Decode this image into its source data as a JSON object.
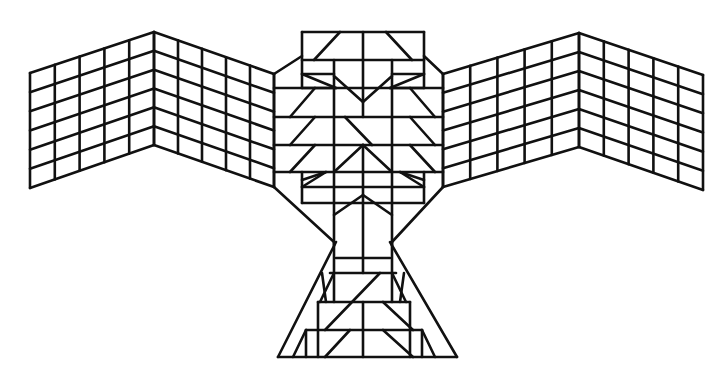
{
  "figure": {
    "title": "Geometric bird (thunderbird) line drawing",
    "stroke_color": "#111111",
    "background": "#ffffff"
  },
  "wings": {
    "left": {
      "outer": {
        "x": 30,
        "top": 73,
        "bottom": 188
      },
      "fold": {
        "x": 154,
        "top": 32,
        "bottom": 145
      },
      "inner": {
        "x": 274,
        "top": 74,
        "bottom": 187
      },
      "columns_per_panel": 5,
      "rows": 6
    },
    "right": {
      "inner": {
        "x": 443,
        "top": 74,
        "bottom": 187
      },
      "fold": {
        "x": 579,
        "top": 33,
        "bottom": 147
      },
      "outer": {
        "x": 703,
        "top": 75,
        "bottom": 190
      },
      "columns_per_panel": 5,
      "rows": 6
    }
  },
  "segments": {
    "head": [
      [
        302,
        32,
        424,
        32
      ],
      [
        302,
        32,
        302,
        88
      ],
      [
        424,
        32,
        424,
        88
      ],
      [
        302,
        60,
        424,
        60
      ],
      [
        363,
        32,
        363,
        88
      ],
      [
        340,
        32,
        314,
        60
      ],
      [
        386,
        32,
        412,
        60
      ],
      [
        302,
        74,
        334,
        74
      ],
      [
        392,
        74,
        424,
        74
      ],
      [
        302,
        88,
        336,
        88
      ],
      [
        390,
        88,
        424,
        88
      ],
      [
        302,
        74,
        336,
        88
      ],
      [
        424,
        74,
        390,
        88
      ],
      [
        274,
        74,
        302,
        56
      ],
      [
        443,
        74,
        424,
        56
      ],
      [
        334,
        60,
        334,
        245
      ],
      [
        392,
        60,
        392,
        245
      ]
    ],
    "body_bands": [
      [
        274,
        88,
        443,
        88
      ],
      [
        274,
        117,
        443,
        117
      ],
      [
        274,
        145,
        443,
        145
      ],
      [
        274,
        172,
        443,
        172
      ],
      [
        302,
        187,
        424,
        187
      ],
      [
        302,
        203,
        424,
        203
      ],
      [
        274,
        74,
        274,
        187
      ],
      [
        443,
        74,
        443,
        187
      ],
      [
        302,
        172,
        302,
        203
      ],
      [
        424,
        172,
        424,
        203
      ],
      [
        363,
        88,
        363,
        117
      ],
      [
        363,
        145,
        363,
        273
      ]
    ],
    "chevrons": [
      [
        334,
        76,
        363,
        102
      ],
      [
        392,
        76,
        363,
        102
      ],
      [
        315,
        88,
        290,
        117
      ],
      [
        410,
        88,
        435,
        117
      ],
      [
        315,
        117,
        290,
        145
      ],
      [
        410,
        117,
        435,
        145
      ],
      [
        345,
        117,
        372,
        145
      ],
      [
        315,
        145,
        290,
        172
      ],
      [
        410,
        145,
        435,
        172
      ],
      [
        334,
        172,
        363,
        145
      ],
      [
        392,
        172,
        363,
        145
      ],
      [
        302,
        180,
        326,
        172
      ],
      [
        424,
        180,
        400,
        172
      ],
      [
        302,
        187,
        326,
        172
      ],
      [
        424,
        187,
        400,
        172
      ]
    ],
    "neck": [
      [
        274,
        187,
        334,
        242
      ],
      [
        443,
        187,
        392,
        242
      ],
      [
        334,
        215,
        363,
        195
      ],
      [
        392,
        215,
        363,
        195
      ]
    ],
    "tail": [
      [
        336,
        242,
        278,
        357
      ],
      [
        390,
        242,
        457,
        357
      ],
      [
        278,
        357,
        457,
        357
      ],
      [
        336,
        258,
        390,
        258
      ],
      [
        330,
        273,
        396,
        273
      ],
      [
        318,
        302,
        410,
        302
      ],
      [
        306,
        330,
        422,
        330
      ],
      [
        334,
        242,
        334,
        302
      ],
      [
        392,
        242,
        392,
        302
      ],
      [
        318,
        302,
        318,
        357
      ],
      [
        410,
        302,
        410,
        357
      ],
      [
        363,
        302,
        363,
        357
      ],
      [
        322,
        273,
        326,
        302
      ],
      [
        404,
        273,
        400,
        302
      ],
      [
        334,
        273,
        320,
        302
      ],
      [
        392,
        273,
        406,
        302
      ],
      [
        380,
        273,
        325,
        330
      ],
      [
        383,
        302,
        413,
        330
      ],
      [
        350,
        330,
        325,
        357
      ],
      [
        383,
        330,
        413,
        357
      ],
      [
        306,
        330,
        306,
        357
      ],
      [
        422,
        330,
        422,
        357
      ],
      [
        306,
        330,
        293,
        357
      ],
      [
        422,
        330,
        435,
        357
      ]
    ]
  }
}
